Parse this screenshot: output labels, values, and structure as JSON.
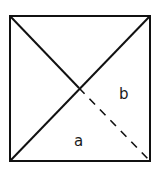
{
  "diagram": {
    "shape": "square with diagonals",
    "square": {
      "x": 10,
      "y": 16,
      "width": 140,
      "height": 145
    },
    "diagonals": [
      {
        "from": "top-left",
        "to": "center",
        "style": "solid"
      },
      {
        "from": "center",
        "to": "bottom-right",
        "style": "dashed"
      },
      {
        "from": "bottom-left",
        "to": "top-right",
        "style": "solid"
      }
    ],
    "labels": [
      {
        "id": "a",
        "text": "a",
        "region": "bottom triangle",
        "x": 80,
        "y": 143
      },
      {
        "id": "b",
        "text": "b",
        "region": "right triangle",
        "x": 124,
        "y": 97
      }
    ],
    "stroke_color": "#111111"
  }
}
